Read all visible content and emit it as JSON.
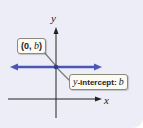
{
  "diagram": {
    "axes": {
      "x_label": "x",
      "y_label": "y"
    },
    "line": {
      "kind": "horizontal",
      "color": "#4a55b8"
    },
    "point": {
      "color": "#3a4a9a"
    },
    "callouts": {
      "point_label": {
        "open": "(",
        "x": "0",
        "sep": ", ",
        "y": "b",
        "close": ")"
      },
      "intercept_label": {
        "prefix": "y",
        "text": "-intercept: ",
        "value": "b"
      }
    },
    "colors": {
      "panel_background": "#ecedf6",
      "axis": "#222222",
      "callout_background": "#fbfbf3",
      "leader_line": "#777777"
    }
  }
}
